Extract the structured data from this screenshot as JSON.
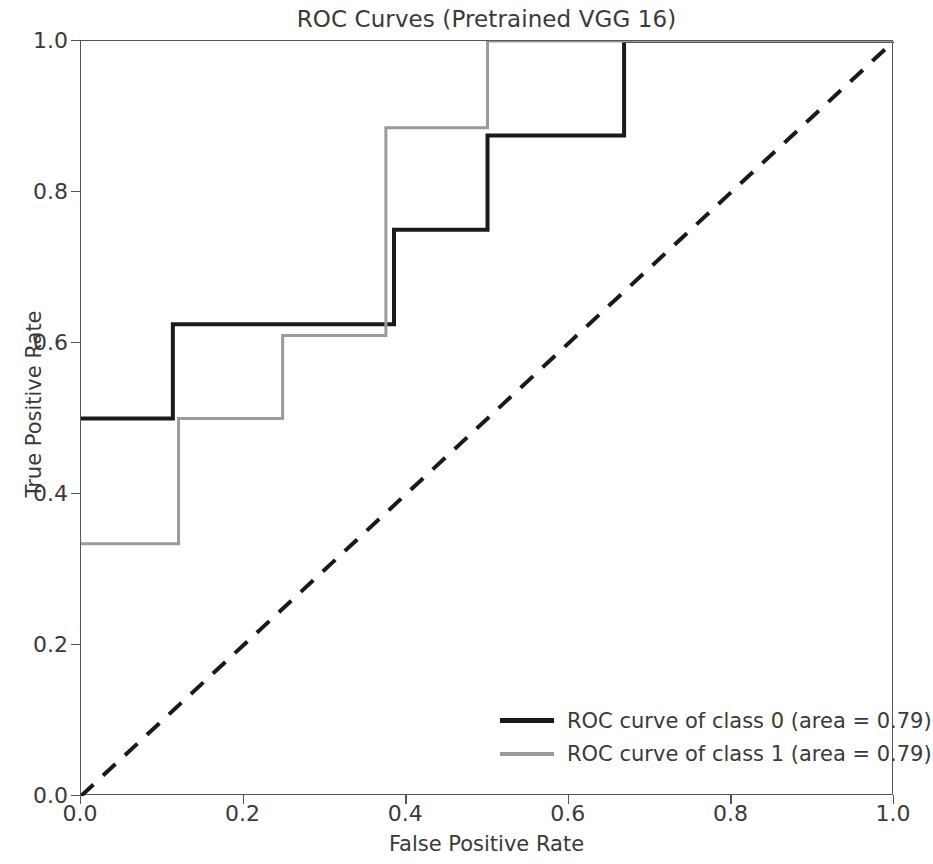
{
  "chart_data": {
    "type": "line",
    "title": "ROC Curves (Pretrained VGG 16)",
    "xlabel": "False Positive Rate",
    "ylabel": "True Positive Rate",
    "xlim": [
      0.0,
      1.0
    ],
    "ylim": [
      0.0,
      1.0
    ],
    "grid": false,
    "legend_position": "lower right",
    "xticks": [
      "0.0",
      "0.2",
      "0.4",
      "0.6",
      "0.8",
      "1.0"
    ],
    "xtick_values": [
      0.0,
      0.2,
      0.4,
      0.6,
      0.8,
      1.0
    ],
    "yticks": [
      "0.0",
      "0.2",
      "0.4",
      "0.6",
      "0.8",
      "1.0"
    ],
    "ytick_values": [
      0.0,
      0.2,
      0.4,
      0.6,
      0.8,
      1.0
    ],
    "drawstyle": "steps-post",
    "series": [
      {
        "name": "ROC curve of class 0 (area = 0.79)",
        "legend_label": "ROC curve of class 0 (area = 0.79)",
        "color": "#1a1a1a",
        "linewidth": 4,
        "linestyle": "solid",
        "auc": 0.79,
        "x": [
          0.0,
          0.113,
          0.113,
          0.385,
          0.385,
          0.5,
          0.5,
          0.668,
          0.668,
          1.0
        ],
        "y": [
          0.5,
          0.5,
          0.625,
          0.625,
          0.75,
          0.75,
          0.875,
          0.875,
          1.0,
          1.0
        ]
      },
      {
        "name": "ROC curve of class 1 (area = 0.79)",
        "legend_label": "ROC curve of class 1 (area = 0.79)",
        "color": "#9a9a9a",
        "linewidth": 3,
        "linestyle": "solid",
        "auc": 0.79,
        "x": [
          0.0,
          0.12,
          0.12,
          0.248,
          0.248,
          0.375,
          0.375,
          0.5,
          0.5,
          1.0
        ],
        "y": [
          0.334,
          0.334,
          0.5,
          0.5,
          0.61,
          0.61,
          0.885,
          0.885,
          1.0,
          1.0
        ]
      },
      {
        "name": "chance-diagonal",
        "legend_label": "",
        "color": "#1a1a1a",
        "linewidth": 4,
        "linestyle": "dashed",
        "x": [
          0.0,
          1.0
        ],
        "y": [
          0.0,
          1.0
        ]
      }
    ]
  }
}
